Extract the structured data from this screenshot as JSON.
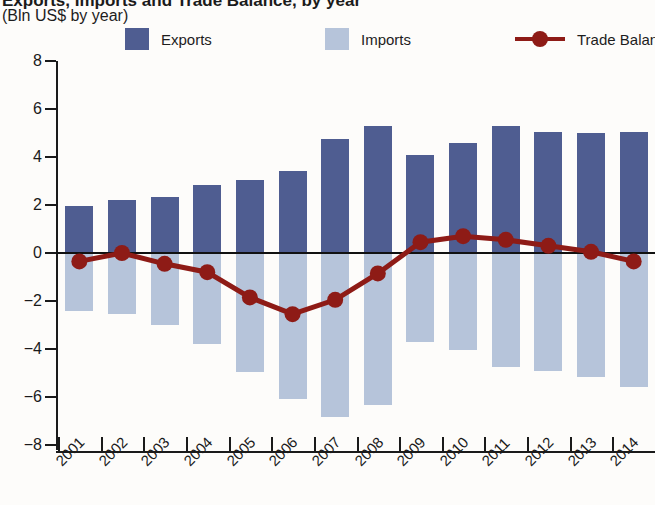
{
  "header": {
    "title": "Exports, Imports and Trade Balance, by year",
    "subtitle": "(Bln US$ by year)"
  },
  "legend": {
    "items": [
      {
        "label": "Exports",
        "marker": "square-swatch",
        "color": "#4f5d91"
      },
      {
        "label": "Imports",
        "marker": "square-swatch",
        "color": "#b6c4da"
      },
      {
        "label": "Trade Balance",
        "marker": "line-with-dot",
        "color": "#8e1b16"
      }
    ]
  },
  "chart_data": {
    "type": "bar",
    "title": "Exports, Imports and Trade Balance, by year",
    "subtitle": "(Bln US$ by year)",
    "xlabel": "",
    "ylabel": "(Bln US$ by year)",
    "ylim": [
      -8,
      8
    ],
    "yticks": [
      8,
      6,
      4,
      2,
      0,
      -2,
      -4,
      -6,
      -8
    ],
    "ytick_labels": [
      "8",
      "6",
      "4",
      "2",
      "0",
      "−2",
      "−4",
      "−6",
      "−8"
    ],
    "grid": false,
    "legend_position": "top",
    "categories": [
      "2001",
      "2002",
      "2003",
      "2004",
      "2005",
      "2006",
      "2007",
      "2008",
      "2009",
      "2010",
      "2011",
      "2012",
      "2013",
      "2014"
    ],
    "series": [
      {
        "name": "Exports",
        "type": "bar",
        "color": "#4f5d91",
        "values": [
          1.95,
          2.2,
          2.35,
          2.85,
          3.05,
          3.4,
          4.75,
          5.3,
          4.1,
          4.6,
          5.3,
          5.05,
          5.0,
          5.05
        ]
      },
      {
        "name": "Imports",
        "type": "bar",
        "color": "#b6c4da",
        "values": [
          -2.4,
          -2.55,
          -3.0,
          -3.8,
          -4.95,
          -6.1,
          -6.85,
          -6.35,
          -3.7,
          -4.05,
          -4.75,
          -4.9,
          -5.15,
          -5.6
        ]
      },
      {
        "name": "Trade Balance",
        "type": "line",
        "color": "#8e1b16",
        "values": [
          -0.35,
          0.0,
          -0.45,
          -0.8,
          -1.85,
          -2.55,
          -1.95,
          -0.85,
          0.45,
          0.7,
          0.55,
          0.3,
          0.05,
          -0.35
        ]
      }
    ]
  }
}
